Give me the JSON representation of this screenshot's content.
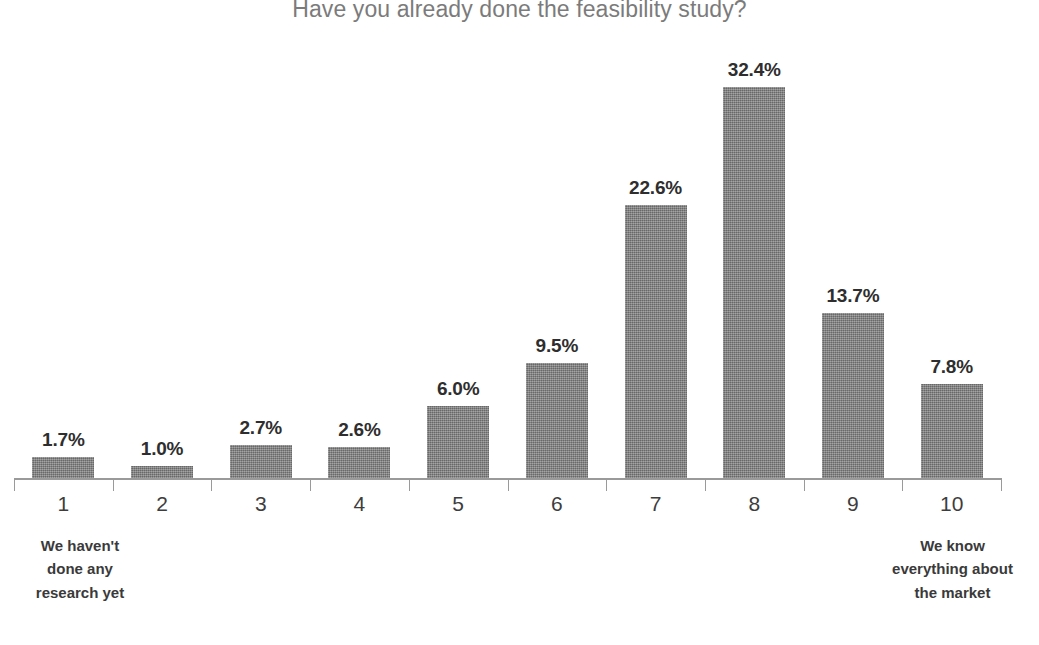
{
  "chart_data": {
    "type": "bar",
    "title": "Have you already done the feasibility study?",
    "subtitle": "",
    "xlabel": "",
    "ylabel": "",
    "grid": false,
    "legend": false,
    "axis_visible": {
      "x": true,
      "y": false
    },
    "ylim": [
      0,
      35
    ],
    "categories": [
      "1",
      "2",
      "3",
      "4",
      "5",
      "6",
      "7",
      "8",
      "9",
      "10"
    ],
    "values": [
      1.7,
      1.0,
      2.7,
      2.6,
      6.0,
      9.5,
      22.6,
      32.4,
      13.7,
      7.8
    ],
    "data_labels": [
      "1.7%",
      "1.0%",
      "2.7%",
      "2.6%",
      "6.0%",
      "9.5%",
      "22.6%",
      "32.4%",
      "13.7%",
      "7.8%"
    ],
    "bar_color": "#808080",
    "title_color": "#7b7b7b",
    "label_color": "#2e2e2e",
    "axis_color": "#9a9a9a",
    "background_color": "#ffffff",
    "annotations": [
      {
        "position": "x-axis-start",
        "lines": [
          "We haven't",
          "done any",
          "research yet"
        ]
      },
      {
        "position": "x-axis-end",
        "lines": [
          "We know",
          "everything about",
          "the market"
        ]
      }
    ]
  }
}
